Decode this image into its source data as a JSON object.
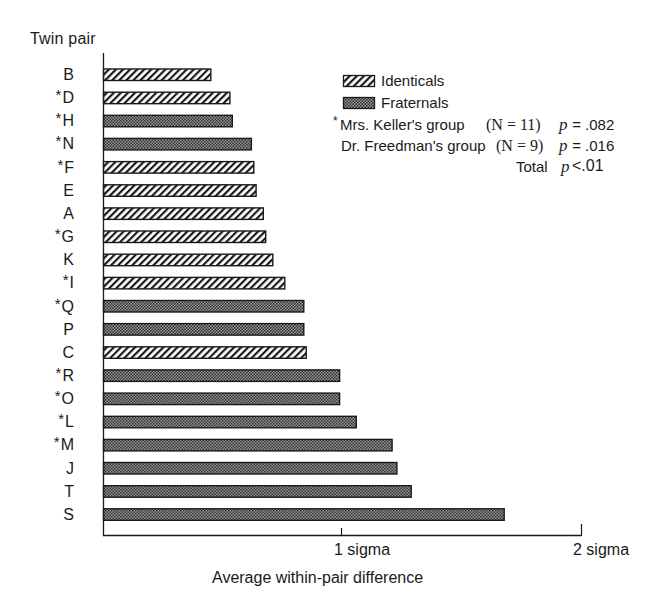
{
  "chart_data": {
    "type": "bar",
    "orientation": "horizontal",
    "title": "",
    "ylabel": "Twin pair",
    "xlabel": "Average within-pair difference",
    "xlim": [
      0,
      2
    ],
    "x_ticks": [
      {
        "value": 1,
        "label": "1 sigma"
      },
      {
        "value": 2,
        "label": "2 sigma"
      }
    ],
    "grid": false,
    "legend_position": "upper right",
    "categories": [
      "B",
      "D",
      "H",
      "N",
      "F",
      "E",
      "A",
      "G",
      "K",
      "I",
      "Q",
      "P",
      "C",
      "R",
      "O",
      "L",
      "M",
      "J",
      "T",
      "S"
    ],
    "category_labels": [
      "B",
      "*D",
      "*H",
      "*N",
      "*F",
      "E",
      "A",
      "*G",
      "K",
      "*I",
      "*Q",
      "P",
      "C",
      "*R",
      "*O",
      "*L",
      "*M",
      "J",
      "T",
      "S"
    ],
    "values": [
      0.45,
      0.53,
      0.54,
      0.62,
      0.63,
      0.64,
      0.67,
      0.68,
      0.71,
      0.76,
      0.84,
      0.84,
      0.85,
      0.99,
      0.99,
      1.06,
      1.21,
      1.23,
      1.29,
      1.68
    ],
    "types": [
      "I",
      "I",
      "F",
      "F",
      "I",
      "I",
      "I",
      "I",
      "I",
      "I",
      "F",
      "F",
      "I",
      "F",
      "F",
      "F",
      "F",
      "F",
      "F",
      "F"
    ],
    "starred": [
      false,
      true,
      true,
      true,
      true,
      false,
      false,
      true,
      false,
      true,
      true,
      false,
      false,
      true,
      true,
      true,
      true,
      false,
      false,
      false
    ],
    "series": [
      {
        "name": "Identicals",
        "code": "I",
        "pattern": "diagonal-hatch"
      },
      {
        "name": "Fraternals",
        "code": "F",
        "pattern": "dense-dots"
      }
    ],
    "annotations": [
      {
        "marker": "*",
        "group": "Mrs. Keller's group",
        "n": "(N = 11)",
        "p": "p = .082"
      },
      {
        "marker": "",
        "group": "Dr. Freedman's group",
        "n": "(N = 9)",
        "p": "p = .016"
      },
      {
        "marker": "",
        "group": "Total",
        "n": "",
        "p": "p < .01"
      }
    ]
  },
  "legend": {
    "identicals": "Identicals",
    "fraternals": "Fraternals"
  },
  "stats": {
    "keller_star": "*",
    "keller_group": "Mrs. Keller's group",
    "keller_n": "(N = 11)",
    "keller_p_sym": "p",
    "keller_p_val": " = .082",
    "freedman_group": "Dr. Freedman's group",
    "freedman_n": "(N = 9)",
    "freedman_p_sym": "p",
    "freedman_p_val": " = .016",
    "total_label": "Total",
    "total_p_sym": "p",
    "total_p_val": "<.01"
  },
  "axes": {
    "y_title": "Twin pair",
    "x_title": "Average within-pair difference",
    "tick1": "1 sigma",
    "tick2": "2 sigma"
  },
  "colors": {
    "ink": "#1a1a1a",
    "fraternal_dark": "#3a3a3a",
    "fraternal_light": "#9a9a9a",
    "background": "#ffffff"
  }
}
